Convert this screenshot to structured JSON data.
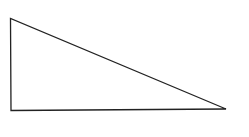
{
  "diagram": {
    "shape": "right-triangle",
    "stroke_color": "#222222",
    "fill_color": "#ffffff",
    "stroke_width": 1.3,
    "vertices": {
      "top": [
        10.5,
        18.5
      ],
      "bottom_left": [
        11,
        110.5
      ],
      "bottom_right": [
        226,
        109
      ]
    },
    "points": "10.5,18.5 11,110.5 226,109"
  }
}
